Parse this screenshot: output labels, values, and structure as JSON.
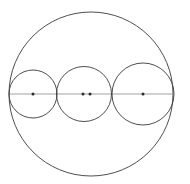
{
  "figure": {
    "canvas": {
      "width": 190,
      "height": 184,
      "background_color": "#ffffff"
    },
    "style": {
      "stroke_color": "#3a3a3a",
      "stroke_color_light": "#8a8a8a",
      "stroke_width": 0.9,
      "diameter_stroke_width": 0.8,
      "dot_color": "#2b2b2b",
      "dot_radius": 1.5
    },
    "outer_circle": {
      "name": "outer-circle",
      "cx": 91,
      "cy": 94,
      "r": 82,
      "label": "Outer circle"
    },
    "inner_circles": [
      {
        "name": "inner-circle-left",
        "cx": 33,
        "cy": 94,
        "r": 24,
        "label": "Left inner circle"
      },
      {
        "name": "inner-circle-middle",
        "cx": 84,
        "cy": 94,
        "r": 27.5,
        "label": "Middle inner circle"
      },
      {
        "name": "inner-circle-right",
        "cx": 143,
        "cy": 94,
        "r": 31,
        "label": "Right inner circle"
      }
    ],
    "diameter": {
      "name": "horizontal-diameter",
      "x1": 9,
      "y1": 94,
      "x2": 173,
      "y2": 94,
      "label": "Horizontal diameter"
    },
    "center_dots": [
      {
        "name": "center-dot-left-circle",
        "cx": 33,
        "cy": 94,
        "label": "Center of left inner circle"
      },
      {
        "name": "center-dot-middle-circle",
        "cx": 83,
        "cy": 94,
        "label": "Center of middle inner circle"
      },
      {
        "name": "center-dot-outer-circle",
        "cx": 90,
        "cy": 94,
        "label": "Center of outer circle"
      },
      {
        "name": "center-dot-right-circle",
        "cx": 143,
        "cy": 94,
        "label": "Center of right inner circle"
      }
    ]
  }
}
